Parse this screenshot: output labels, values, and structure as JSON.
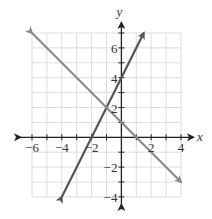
{
  "chart_data": {
    "type": "line",
    "title": "",
    "xlabel": "x",
    "ylabel": "y",
    "xlim": [
      -6,
      4
    ],
    "ylim": [
      -4,
      7
    ],
    "grid": true,
    "x_ticks": [
      "-6",
      "-4",
      "-2",
      "2",
      "4"
    ],
    "y_ticks": [
      "6",
      "4",
      "2",
      "-2",
      "-4"
    ],
    "series": [
      {
        "name": "Line 1",
        "equation": "y = 2x + 4",
        "color": "#555555",
        "points": [
          [
            -4,
            -4
          ],
          [
            1.5,
            7
          ]
        ]
      },
      {
        "name": "Line 2",
        "equation": "y = -x + 1",
        "color": "#8a8a8a",
        "points": [
          [
            -6,
            7
          ],
          [
            4,
            -3
          ]
        ]
      }
    ],
    "intersection": [
      -1,
      2
    ]
  }
}
